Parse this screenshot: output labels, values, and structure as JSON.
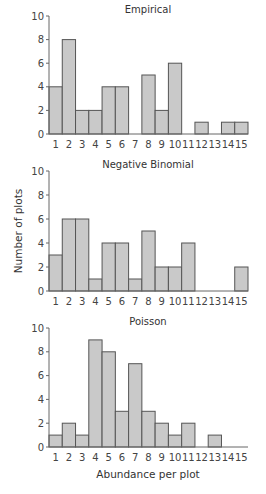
{
  "figure": {
    "ylabel": "Number of plots",
    "xlabel": "Abundance per plot"
  },
  "chart_data": [
    {
      "type": "bar",
      "title": "Empirical",
      "categories": [
        "1",
        "2",
        "3",
        "4",
        "5",
        "6",
        "7",
        "8",
        "9",
        "10",
        "11",
        "12",
        "13",
        "14",
        "15"
      ],
      "values": [
        4,
        8,
        2,
        2,
        4,
        4,
        0,
        5,
        2,
        6,
        0,
        1,
        0,
        1,
        1
      ],
      "xlabel": "",
      "ylabel": "",
      "ylim": [
        0,
        10
      ],
      "yticks": [
        0,
        2,
        4,
        6,
        8,
        10
      ],
      "grid": false,
      "color": "#c9c9c9"
    },
    {
      "type": "bar",
      "title": "Negative Binomial",
      "categories": [
        "1",
        "2",
        "3",
        "4",
        "5",
        "6",
        "7",
        "8",
        "9",
        "10",
        "11",
        "12",
        "13",
        "14",
        "15"
      ],
      "values": [
        3,
        6,
        6,
        1,
        4,
        4,
        1,
        5,
        2,
        2,
        4,
        0,
        0,
        0,
        2
      ],
      "xlabel": "",
      "ylabel": "Number of plots",
      "ylim": [
        0,
        10
      ],
      "yticks": [
        0,
        2,
        4,
        6,
        8,
        10
      ],
      "grid": false,
      "color": "#c9c9c9"
    },
    {
      "type": "bar",
      "title": "Poisson",
      "categories": [
        "1",
        "2",
        "3",
        "4",
        "5",
        "6",
        "7",
        "8",
        "9",
        "10",
        "11",
        "12",
        "13",
        "14",
        "15"
      ],
      "values": [
        1,
        2,
        1,
        9,
        8,
        3,
        7,
        3,
        2,
        1,
        2,
        0,
        1,
        0,
        0
      ],
      "xlabel": "Abundance per plot",
      "ylabel": "",
      "ylim": [
        0,
        10
      ],
      "yticks": [
        0,
        2,
        4,
        6,
        8,
        10
      ],
      "grid": false,
      "color": "#c9c9c9"
    }
  ]
}
